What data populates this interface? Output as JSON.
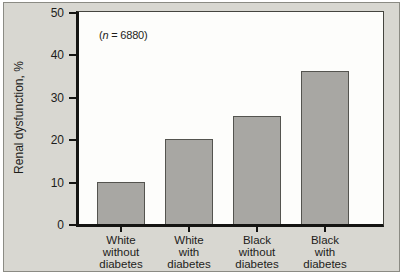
{
  "figure": {
    "colors": {
      "background": "#d8d7d1",
      "frame_border": "#8b8b84",
      "plot_background": "#fdfdfb",
      "plot_border": "#45453f",
      "axis": "#141412",
      "bar_fill": "#a8a7a3",
      "bar_border": "#54544f",
      "text": "#1d1d1b"
    }
  },
  "annotation": {
    "pre": "(",
    "var": "n",
    "post": " = 6880)"
  },
  "chart_data": {
    "type": "bar",
    "title": "",
    "xlabel": "",
    "ylabel": "Renal dysfunction, %",
    "ylim": [
      0,
      50
    ],
    "yticks": [
      0,
      10,
      20,
      30,
      40,
      50
    ],
    "grid": false,
    "legend": "none",
    "annotation": "(n = 6880)",
    "categories": [
      "White without diabetes",
      "White with diabetes",
      "Black without diabetes",
      "Black with diabetes"
    ],
    "category_lines": [
      [
        "White",
        "without",
        "diabetes"
      ],
      [
        "White",
        "with",
        "diabetes"
      ],
      [
        "Black",
        "without",
        "diabetes"
      ],
      [
        "Black",
        "with",
        "diabetes"
      ]
    ],
    "values": [
      10,
      20,
      25.5,
      36
    ]
  }
}
